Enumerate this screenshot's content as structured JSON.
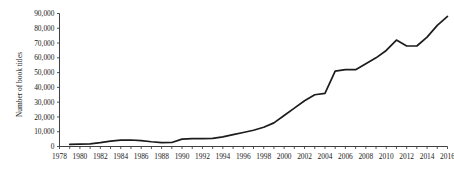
{
  "chart_data": {
    "type": "line",
    "title": "",
    "subtitle": "",
    "xlabel": "",
    "ylabel": "Number of book titles",
    "xlim": [
      1978,
      2016
    ],
    "ylim": [
      0,
      90000
    ],
    "grid": false,
    "legend": false,
    "legend_position": "none",
    "y_ticks": [
      0,
      10000,
      20000,
      30000,
      40000,
      50000,
      60000,
      70000,
      80000,
      90000
    ],
    "y_tick_labels": [
      "0",
      "10,000",
      "20,000",
      "30,000",
      "40,000",
      "50,000",
      "60,000",
      "70,000",
      "80,000",
      "90,000"
    ],
    "x_ticks": [
      1978,
      1980,
      1982,
      1984,
      1986,
      1988,
      1990,
      1992,
      1994,
      1996,
      1998,
      2000,
      2002,
      2004,
      2006,
      2008,
      2010,
      2012,
      2014,
      2016
    ],
    "x_tick_labels": [
      "1978",
      "1980",
      "1982",
      "1984",
      "1986",
      "1988",
      "1990",
      "1992",
      "1994",
      "1996",
      "1998",
      "2000",
      "2002",
      "2004",
      "2006",
      "2008",
      "2010",
      "2012",
      "2014",
      "2016"
    ],
    "x_minor_tick_interval": 1,
    "line_color": "#1c1c1c",
    "x": [
      1979,
      1980,
      1981,
      1982,
      1983,
      1984,
      1985,
      1986,
      1987,
      1988,
      1989,
      1990,
      1991,
      1992,
      1993,
      1994,
      1995,
      1996,
      1997,
      1998,
      1999,
      2000,
      2001,
      2002,
      2003,
      2004,
      2005,
      2006,
      2007,
      2008,
      2009,
      2010,
      2011,
      2012,
      2013,
      2014,
      2015,
      2016
    ],
    "values": [
      1500,
      1600,
      1800,
      2600,
      3600,
      4300,
      4400,
      4000,
      3200,
      2600,
      2700,
      5000,
      5300,
      5300,
      5500,
      6500,
      8000,
      9500,
      11000,
      13000,
      16000,
      21000,
      26000,
      31000,
      35000,
      36000,
      51000,
      52000,
      52000,
      56000,
      60000,
      65000,
      72000,
      68000,
      68000,
      74000,
      82000,
      88000
    ]
  },
  "axis": {
    "y_title": "Number of book titles"
  }
}
